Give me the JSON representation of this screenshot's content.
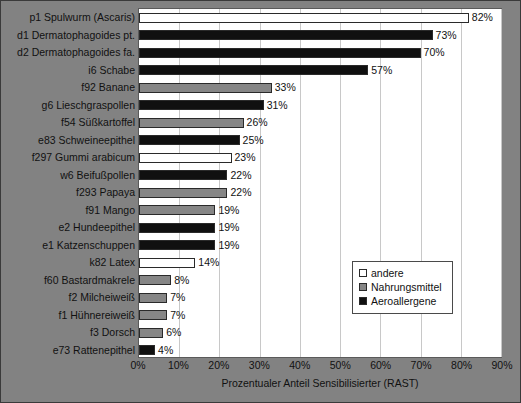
{
  "chart_data": {
    "type": "bar",
    "orientation": "horizontal",
    "title": "",
    "xlabel": "Prozentualer Anteil Sensibilisierter (RAST)",
    "ylabel": "",
    "xlim": [
      0,
      90
    ],
    "xticks": [
      "0%",
      "10%",
      "20%",
      "30%",
      "40%",
      "50%",
      "60%",
      "70%",
      "80%",
      "90%"
    ],
    "xtick_values": [
      0,
      10,
      20,
      30,
      40,
      50,
      60,
      70,
      80,
      90
    ],
    "grid": true,
    "legend_position": "lower-right",
    "categories": [
      "p1  Spulwurm (Ascaris)",
      "d1  Dermatophagoides pt.",
      "d2  Dermatophagoides fa.",
      "i6  Schabe",
      "f92  Banane",
      "g6  Lieschgraspollen",
      "f54  Süßkartoffel",
      "e83  Schweineepithel",
      "f297  Gummi arabicum",
      "w6  Beifußpollen",
      "f293  Papaya",
      "f91  Mango",
      "e2  Hundeepithel",
      "e1  Katzenschuppen",
      "k82  Latex",
      "f60  Bastardmakrele",
      "f2  Milcheiweiß",
      "f1  Hühnereiweiß",
      "f3  Dorsch",
      "e73  Rattenepithel"
    ],
    "values": [
      82,
      73,
      70,
      57,
      33,
      31,
      26,
      25,
      23,
      22,
      22,
      19,
      19,
      19,
      14,
      8,
      7,
      7,
      6,
      4
    ],
    "value_labels": [
      "82%",
      "73%",
      "70%",
      "57%",
      "33%",
      "31%",
      "26%",
      "25%",
      "23%",
      "22%",
      "22%",
      "19%",
      "19%",
      "19%",
      "14%",
      "8%",
      "7%",
      "7%",
      "6%",
      "4%"
    ],
    "groups": [
      "andere",
      "aeroallergene",
      "aeroallergene",
      "aeroallergene",
      "nahrungsmittel",
      "aeroallergene",
      "nahrungsmittel",
      "aeroallergene",
      "andere",
      "aeroallergene",
      "nahrungsmittel",
      "nahrungsmittel",
      "aeroallergene",
      "aeroallergene",
      "andere",
      "nahrungsmittel",
      "nahrungsmittel",
      "nahrungsmittel",
      "nahrungsmittel",
      "aeroallergene"
    ],
    "legend": [
      {
        "key": "andere",
        "label": "andere",
        "color": "#ffffff"
      },
      {
        "key": "nahrungsmittel",
        "label": "Nahrungsmittel",
        "color": "#868686"
      },
      {
        "key": "aeroallergene",
        "label": "Aeroallergene",
        "color": "#101010"
      }
    ]
  },
  "colors": {
    "background": "#828282",
    "plot_background": "#ffffff",
    "gridline": "#c8c8c8",
    "text": "#111111"
  }
}
